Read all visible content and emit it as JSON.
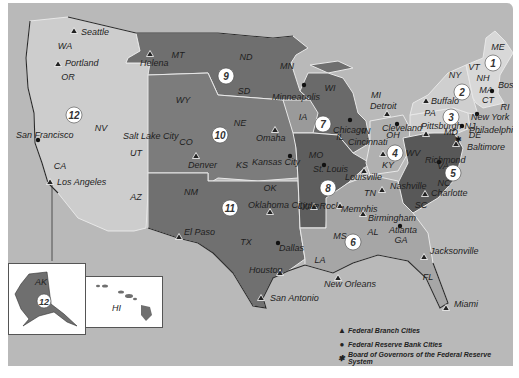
{
  "map": {
    "title": "Federal Reserve Districts",
    "colors": {
      "background": "#b9b9b9",
      "light_district": "#cdcdcd",
      "mid_district": "#8f8f8f",
      "dark_district": "#6a6a6a",
      "darker_district": "#555555",
      "inset_bg": "#ffffff"
    },
    "states": [
      {
        "abbr": "WA",
        "x": 57,
        "y": 46
      },
      {
        "abbr": "OR",
        "x": 60,
        "y": 77
      },
      {
        "abbr": "CA",
        "x": 52,
        "y": 166
      },
      {
        "abbr": "NV",
        "x": 93,
        "y": 128
      },
      {
        "abbr": "UT",
        "x": 128,
        "y": 153
      },
      {
        "abbr": "AZ",
        "x": 128,
        "y": 197
      },
      {
        "abbr": "MT",
        "x": 170,
        "y": 55
      },
      {
        "abbr": "WY",
        "x": 175,
        "y": 100
      },
      {
        "abbr": "CO",
        "x": 178,
        "y": 142
      },
      {
        "abbr": "NM",
        "x": 183,
        "y": 192
      },
      {
        "abbr": "ND",
        "x": 238,
        "y": 57
      },
      {
        "abbr": "SD",
        "x": 236,
        "y": 91
      },
      {
        "abbr": "NE",
        "x": 232,
        "y": 123
      },
      {
        "abbr": "KS",
        "x": 234,
        "y": 165
      },
      {
        "abbr": "OK",
        "x": 262,
        "y": 188
      },
      {
        "abbr": "TX",
        "x": 238,
        "y": 242
      },
      {
        "abbr": "MN",
        "x": 279,
        "y": 66
      },
      {
        "abbr": "IA",
        "x": 295,
        "y": 117
      },
      {
        "abbr": "MO",
        "x": 308,
        "y": 155
      },
      {
        "abbr": "AR",
        "x": 305,
        "y": 207
      },
      {
        "abbr": "LA",
        "x": 312,
        "y": 260
      },
      {
        "abbr": "WI",
        "x": 322,
        "y": 88
      },
      {
        "abbr": "IL",
        "x": 332,
        "y": 137
      },
      {
        "abbr": "MI",
        "x": 368,
        "y": 95
      },
      {
        "abbr": "IN",
        "x": 358,
        "y": 131
      },
      {
        "abbr": "OH",
        "x": 385,
        "y": 135
      },
      {
        "abbr": "KY",
        "x": 380,
        "y": 165
      },
      {
        "abbr": "TN",
        "x": 362,
        "y": 193
      },
      {
        "abbr": "MS",
        "x": 332,
        "y": 236
      },
      {
        "abbr": "AL",
        "x": 365,
        "y": 232
      },
      {
        "abbr": "GA",
        "x": 393,
        "y": 240
      },
      {
        "abbr": "FL",
        "x": 420,
        "y": 277
      },
      {
        "abbr": "SC",
        "x": 413,
        "y": 205
      },
      {
        "abbr": "NC",
        "x": 436,
        "y": 183
      },
      {
        "abbr": "VA",
        "x": 435,
        "y": 166
      },
      {
        "abbr": "WV",
        "x": 405,
        "y": 153
      },
      {
        "abbr": "PA",
        "x": 422,
        "y": 113
      },
      {
        "abbr": "NY",
        "x": 447,
        "y": 75
      },
      {
        "abbr": "VT",
        "x": 466,
        "y": 67
      },
      {
        "abbr": "NH",
        "x": 475,
        "y": 78
      },
      {
        "abbr": "ME",
        "x": 490,
        "y": 47
      },
      {
        "abbr": "MA",
        "x": 478,
        "y": 90
      },
      {
        "abbr": "CT",
        "x": 480,
        "y": 100
      },
      {
        "abbr": "RI",
        "x": 497,
        "y": 107
      },
      {
        "abbr": "NJ",
        "x": 462,
        "y": 126
      },
      {
        "abbr": "DE",
        "x": 467,
        "y": 135
      },
      {
        "abbr": "MD",
        "x": 443,
        "y": 132
      }
    ],
    "districts": [
      {
        "number": "1",
        "x": 485,
        "y": 60
      },
      {
        "number": "2",
        "x": 454,
        "y": 89
      },
      {
        "number": "3",
        "x": 443,
        "y": 114
      },
      {
        "number": "4",
        "x": 387,
        "y": 150
      },
      {
        "number": "5",
        "x": 445,
        "y": 170
      },
      {
        "number": "6",
        "x": 345,
        "y": 239
      },
      {
        "number": "7",
        "x": 315,
        "y": 121
      },
      {
        "number": "8",
        "x": 320,
        "y": 185
      },
      {
        "number": "9",
        "x": 218,
        "y": 73
      },
      {
        "number": "10",
        "x": 212,
        "y": 132
      },
      {
        "number": "11",
        "x": 222,
        "y": 205
      },
      {
        "number": "12",
        "x": 66,
        "y": 112
      }
    ],
    "branch_cities": [
      {
        "name": "Seattle",
        "x": 66,
        "y": 28,
        "lx": 73,
        "ly": 32
      },
      {
        "name": "Portland",
        "x": 50,
        "y": 61,
        "lx": 57,
        "ly": 63
      },
      {
        "name": "Los Angeles",
        "x": 42,
        "y": 179,
        "lx": 49,
        "ly": 182
      },
      {
        "name": "Salt Lake City",
        "x": 0,
        "y": 0,
        "lx": 115,
        "ly": 136,
        "nomark": true
      },
      {
        "name": "Helena",
        "x": 142,
        "y": 51,
        "lx": 132,
        "ly": 63
      },
      {
        "name": "Denver",
        "x": 188,
        "y": 153,
        "lx": 180,
        "ly": 165
      },
      {
        "name": "Omaha",
        "x": 267,
        "y": 127,
        "lx": 248,
        "ly": 138
      },
      {
        "name": "Oklahoma City",
        "x": 262,
        "y": 209,
        "lx": 240,
        "ly": 205
      },
      {
        "name": "El Paso",
        "x": 171,
        "y": 234,
        "lx": 176,
        "ly": 232
      },
      {
        "name": "Houston",
        "x": 272,
        "y": 270,
        "lx": 241,
        "ly": 270
      },
      {
        "name": "San Antonio",
        "x": 253,
        "y": 295,
        "lx": 262,
        "ly": 298
      },
      {
        "name": "Little Rock",
        "x": 306,
        "y": 204,
        "lx": 290,
        "ly": 206
      },
      {
        "name": "Memphis",
        "x": 332,
        "y": 203,
        "lx": 333,
        "ly": 209
      },
      {
        "name": "Louisville",
        "x": 356,
        "y": 168,
        "lx": 337,
        "ly": 177
      },
      {
        "name": "Nashville",
        "x": 374,
        "y": 187,
        "lx": 382,
        "ly": 186
      },
      {
        "name": "Birmingham",
        "x": 355,
        "y": 211,
        "lx": 360,
        "ly": 218
      },
      {
        "name": "Jacksonville",
        "x": 416,
        "y": 254,
        "lx": 422,
        "ly": 251
      },
      {
        "name": "Miami",
        "x": 438,
        "y": 305,
        "lx": 446,
        "ly": 304
      },
      {
        "name": "New Orleans",
        "x": 330,
        "y": 275,
        "lx": 316,
        "ly": 284
      },
      {
        "name": "Detroit",
        "x": 379,
        "y": 111,
        "lx": 362,
        "ly": 106
      },
      {
        "name": "Cincinnati",
        "x": 375,
        "y": 151,
        "lx": 340,
        "ly": 142
      },
      {
        "name": "Buffalo",
        "x": 418,
        "y": 98,
        "lx": 423,
        "ly": 101
      },
      {
        "name": "Pittsburgh",
        "x": 418,
        "y": 131,
        "lx": 413,
        "ly": 126
      },
      {
        "name": "Baltimore",
        "x": 448,
        "y": 141,
        "lx": 459,
        "ly": 147
      },
      {
        "name": "Charlotte",
        "x": 417,
        "y": 191,
        "lx": 423,
        "ly": 193
      }
    ],
    "bank_cities": [
      {
        "name": "San Francisco",
        "x": 30,
        "y": 137,
        "lx": 8,
        "ly": 135
      },
      {
        "name": "Minneapolis",
        "x": 296,
        "y": 82,
        "lx": 264,
        "ly": 97
      },
      {
        "name": "Kansas City",
        "x": 282,
        "y": 153,
        "lx": 244,
        "ly": 162
      },
      {
        "name": "Dallas",
        "x": 270,
        "y": 240,
        "lx": 271,
        "ly": 248
      },
      {
        "name": "St. Louis",
        "x": 316,
        "y": 162,
        "lx": 305,
        "ly": 169
      },
      {
        "name": "Chicago",
        "x": 342,
        "y": 117,
        "lx": 325,
        "ly": 130
      },
      {
        "name": "Atlanta",
        "x": 392,
        "y": 223,
        "lx": 381,
        "ly": 230
      },
      {
        "name": "Cleveland",
        "x": 389,
        "y": 121,
        "lx": 374,
        "ly": 128
      },
      {
        "name": "Philadelphia",
        "x": 454,
        "y": 123,
        "lx": 461,
        "ly": 130
      },
      {
        "name": "New York",
        "x": 469,
        "y": 111,
        "lx": 463,
        "ly": 117
      },
      {
        "name": "Boston",
        "x": 484,
        "y": 88,
        "lx": 490,
        "ly": 85
      },
      {
        "name": "Richmond",
        "x": 431,
        "y": 159,
        "lx": 417,
        "ly": 160
      }
    ],
    "board_city": {
      "name": "Washington",
      "x": 450,
      "y": 136
    },
    "insets": {
      "alaska": {
        "label": "AK",
        "district": "12"
      },
      "hawaii": {
        "label": "HI"
      }
    },
    "legend": [
      {
        "icon": "triangle",
        "label": "Federal Branch Cities"
      },
      {
        "icon": "dot",
        "label": "Federal Reserve Bank Cities"
      },
      {
        "icon": "star",
        "label": "Board of Governors of the Federal Reserve System"
      }
    ]
  }
}
